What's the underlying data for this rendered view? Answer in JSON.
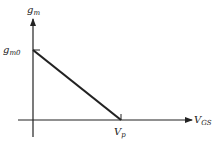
{
  "diagram": {
    "type": "transconductance-vs-gate-voltage",
    "y_axis": {
      "label": "g",
      "label_sub": "m"
    },
    "x_axis": {
      "label": "V",
      "label_sub": "GS"
    },
    "points": {
      "gm0": {
        "label": "g",
        "label_sub": "m0"
      },
      "vp": {
        "label": "V",
        "label_sub": "p"
      }
    },
    "line": {
      "from": "gm0",
      "to": "vp",
      "description": "linear decrease of g_m from g_m0 at V_GS=0 to zero at V_p"
    },
    "colors": {
      "stroke": "#222222",
      "background": "#ffffff"
    }
  }
}
